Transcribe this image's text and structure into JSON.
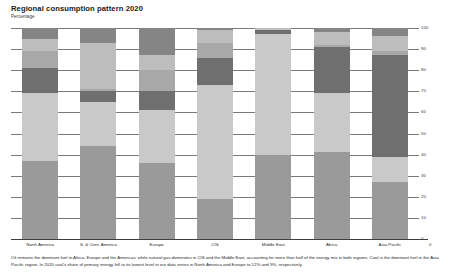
{
  "header": {
    "title": "Regional consumption pattern 2020",
    "subtitle": "Percentage"
  },
  "caption": "Oil remains the dominant fuel in Africa, Europe and the Americas, while natural gas dominates in CIS and the Middle East, accounting for more than half of the energy mix in both regions. Coal is the dominant fuel in the Asia Pacific region. In 2020 coal's share of primary energy fell to its lowest level in our data series in North America and Europe to 12% and 9%, respectively.",
  "colors": {
    "oil": "#9a9a9a",
    "gas": "#c9c9c9",
    "coal": "#6f6f6f",
    "nuclear": "#a8a8a8",
    "hydro": "#bdbdbd",
    "renewables": "#858585",
    "axis": "#3f3f3f",
    "grid": "#7a7a7a"
  },
  "chart_data": {
    "type": "bar",
    "stacked": true,
    "title": "Regional consumption pattern 2020",
    "subtitle": "Percentage",
    "xlabel": "",
    "ylabel": "Percentage",
    "ylim": [
      0,
      100
    ],
    "yticks": [
      0,
      10,
      20,
      30,
      40,
      50,
      60,
      70,
      80,
      90,
      100
    ],
    "ytick_labels": [
      "0",
      "10",
      "20",
      "30",
      "40",
      "50",
      "60",
      "70",
      "80",
      "90",
      "100"
    ],
    "yaxis_position": "right",
    "grid": true,
    "legend": "none",
    "categories": [
      "North America",
      "S. & Cent. America",
      "Europe",
      "CIS",
      "Middle East",
      "Africa",
      "Asia Pacific"
    ],
    "series": [
      {
        "name": "Oil",
        "values": [
          37,
          44,
          36,
          19,
          40,
          41,
          27
        ]
      },
      {
        "name": "Natural Gas",
        "values": [
          32,
          21,
          25,
          54,
          57,
          28,
          12
        ]
      },
      {
        "name": "Coal",
        "values": [
          12,
          5,
          9,
          13,
          2,
          22,
          48
        ]
      },
      {
        "name": "Nuclear",
        "values": [
          8,
          1,
          10,
          7,
          0,
          1,
          2
        ]
      },
      {
        "name": "Hydro",
        "values": [
          6,
          22,
          7,
          6,
          1,
          6,
          7
        ]
      },
      {
        "name": "Renewables",
        "values": [
          5,
          7,
          13,
          1,
          0,
          2,
          4
        ]
      }
    ],
    "series_order_bottom_to_top": [
      "Oil",
      "Natural Gas",
      "Coal",
      "Nuclear",
      "Hydro",
      "Renewables"
    ]
  }
}
